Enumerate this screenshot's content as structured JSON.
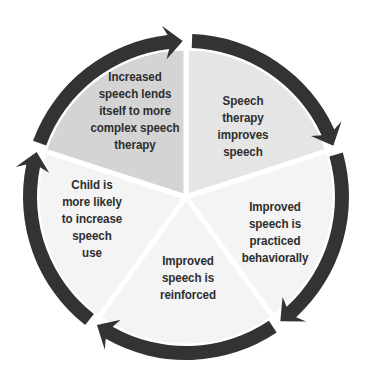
{
  "diagram": {
    "type": "cycle",
    "center": [
      186,
      197
    ],
    "ring_radius": 156,
    "ring_width": 14,
    "sector_radius": 149,
    "colors": {
      "ring": "#333333",
      "sector_dark": "#d4d4d4",
      "sector_mid": "#e5e5e5",
      "sector_light": "#f4f4f4",
      "separator": "#ffffff",
      "text": "#2e2e2e"
    },
    "gap_angles_deg": [
      -90,
      -18,
      54,
      126,
      198
    ],
    "steps": [
      {
        "id": "speech-therapy-improves-speech",
        "lines": [
          "Speech",
          "therapy",
          "improves",
          "speech"
        ],
        "position": [
          243,
          126
        ],
        "fill": "#e5e5e5"
      },
      {
        "id": "improved-speech-practiced",
        "lines": [
          "Improved",
          "speech is",
          "practiced",
          "behaviorally"
        ],
        "position": [
          275,
          232
        ],
        "fill": "#f4f4f4"
      },
      {
        "id": "improved-speech-reinforced",
        "lines": [
          "Improved",
          "speech is",
          "reinforced"
        ],
        "position": [
          188,
          277
        ],
        "fill": "#f4f4f4"
      },
      {
        "id": "child-more-likely",
        "lines": [
          "Child is",
          "more likely",
          "to increase",
          "speech",
          "use"
        ],
        "position": [
          92,
          218
        ],
        "fill": "#f4f4f4"
      },
      {
        "id": "increased-speech-complex-therapy",
        "lines": [
          "Increased",
          "speech lends",
          "itself to more",
          "complex speech",
          "therapy"
        ],
        "position": [
          135,
          110
        ],
        "fill": "#d4d4d4"
      }
    ]
  }
}
